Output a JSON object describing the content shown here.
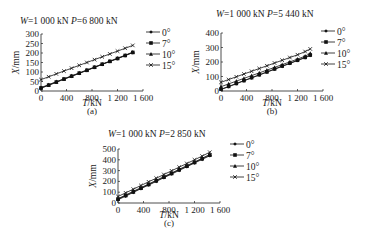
{
  "chart_data": [
    {
      "id": "a",
      "type": "line",
      "title": "W=1 000 kN  P=6 800 kN",
      "title_parts": {
        "w_label": "W",
        "w_value": "=1 000 kN",
        "p_label": "P",
        "p_value": "=6 800 kN"
      },
      "caption": "(a)",
      "xlabel": "T/kN",
      "ylabel": "X/mm",
      "xlim": [
        0,
        1600
      ],
      "ylim": [
        0,
        300
      ],
      "xticks": [
        0,
        400,
        800,
        1200,
        1600
      ],
      "xtick_labels": [
        "0",
        "400",
        "800",
        "1 200",
        "1 600"
      ],
      "yticks": [
        0,
        50,
        100,
        150,
        200,
        250,
        300
      ],
      "grid": false,
      "legend_position": "right",
      "x": [
        0,
        120,
        240,
        360,
        480,
        600,
        720,
        840,
        960,
        1080,
        1200,
        1320,
        1440
      ],
      "series": [
        {
          "name": "0°",
          "marker": "diamond",
          "values": [
            15,
            30,
            46,
            62,
            77,
            93,
            108,
            124,
            140,
            155,
            170,
            186,
            202
          ]
        },
        {
          "name": "7°",
          "marker": "square",
          "values": [
            16,
            31,
            47,
            63,
            78,
            94,
            109,
            125,
            141,
            156,
            171,
            187,
            203
          ]
        },
        {
          "name": "10°",
          "marker": "triangle",
          "values": [
            18,
            33,
            49,
            64,
            80,
            95,
            111,
            126,
            142,
            157,
            173,
            188,
            205
          ]
        },
        {
          "name": "15°",
          "marker": "x",
          "values": [
            60,
            75,
            90,
            105,
            120,
            135,
            150,
            165,
            180,
            195,
            210,
            225,
            240
          ]
        }
      ]
    },
    {
      "id": "b",
      "type": "line",
      "title": "W=1 000 kN  P=5 440 kN",
      "title_parts": {
        "w_label": "W",
        "w_value": "=1 000 kN",
        "p_label": "P",
        "p_value": "=5 440 kN"
      },
      "caption": "(b)",
      "xlabel": "T/kN",
      "ylabel": "X/mm",
      "xlim": [
        0,
        1600
      ],
      "ylim": [
        0,
        400
      ],
      "xticks": [
        0,
        400,
        800,
        1200,
        1600
      ],
      "xtick_labels": [
        "0",
        "400",
        "800",
        "1 200",
        "1 600"
      ],
      "yticks": [
        0,
        100,
        200,
        300,
        400
      ],
      "grid": false,
      "legend_position": "right",
      "x": [
        0,
        120,
        240,
        360,
        480,
        600,
        720,
        840,
        960,
        1080,
        1200,
        1320,
        1400
      ],
      "series": [
        {
          "name": "0°",
          "marker": "diamond",
          "values": [
            10,
            30,
            50,
            70,
            90,
            110,
            130,
            150,
            170,
            190,
            210,
            230,
            245
          ]
        },
        {
          "name": "7°",
          "marker": "square",
          "values": [
            12,
            32,
            52,
            72,
            92,
            112,
            132,
            152,
            172,
            192,
            212,
            232,
            248
          ]
        },
        {
          "name": "10°",
          "marker": "triangle",
          "values": [
            30,
            49,
            68,
            87,
            106,
            125,
            144,
            163,
            182,
            201,
            220,
            240,
            260
          ]
        },
        {
          "name": "15°",
          "marker": "x",
          "values": [
            60,
            79,
            98,
            117,
            136,
            155,
            174,
            193,
            212,
            231,
            250,
            272,
            290
          ]
        }
      ]
    },
    {
      "id": "c",
      "type": "line",
      "title": "W=1 000 kN  P=2 850 kN",
      "title_parts": {
        "w_label": "W",
        "w_value": "=1 000 kN",
        "p_label": "P",
        "p_value": "=2 850 kN"
      },
      "caption": "(c)",
      "xlabel": "T/kN",
      "ylabel": "X/mm",
      "xlim": [
        0,
        1600
      ],
      "ylim": [
        0,
        500
      ],
      "xticks": [
        0,
        400,
        800,
        1200,
        1600
      ],
      "xtick_labels": [
        "0",
        "400",
        "800",
        "1 200",
        "1 600"
      ],
      "yticks": [
        0,
        100,
        200,
        300,
        400,
        500
      ],
      "grid": false,
      "legend_position": "right",
      "x": [
        0,
        120,
        240,
        360,
        480,
        600,
        720,
        840,
        960,
        1080,
        1200,
        1320,
        1440
      ],
      "series": [
        {
          "name": "0°",
          "marker": "diamond",
          "values": [
            30,
            64,
            98,
            132,
            166,
            200,
            234,
            268,
            302,
            336,
            370,
            404,
            438
          ]
        },
        {
          "name": "7°",
          "marker": "square",
          "values": [
            35,
            69,
            103,
            137,
            171,
            205,
            239,
            273,
            307,
            341,
            375,
            409,
            443
          ]
        },
        {
          "name": "10°",
          "marker": "triangle",
          "values": [
            40,
            74,
            108,
            142,
            176,
            210,
            244,
            278,
            312,
            346,
            380,
            414,
            450
          ]
        },
        {
          "name": "15°",
          "marker": "x",
          "values": [
            60,
            94,
            128,
            162,
            196,
            230,
            264,
            298,
            332,
            366,
            400,
            434,
            470
          ]
        }
      ]
    }
  ],
  "layout_px": [
    {
      "x0": 41,
      "y0": 91,
      "x1": 143,
      "y1": 34,
      "title_x": 20,
      "title_y": 24,
      "legend_x": 146,
      "legend_y": 32,
      "caption_y": 114,
      "xlabel_y": 106
    },
    {
      "x0": 221,
      "y0": 91,
      "x1": 323,
      "y1": 33,
      "title_x": 216,
      "title_y": 17,
      "legend_x": 321,
      "legend_y": 31,
      "caption_y": 114,
      "xlabel_y": 106
    },
    {
      "x0": 118,
      "y0": 203,
      "x1": 220,
      "y1": 149,
      "title_x": 108,
      "title_y": 137,
      "legend_x": 230,
      "legend_y": 144,
      "caption_y": 226,
      "xlabel_y": 218
    }
  ]
}
